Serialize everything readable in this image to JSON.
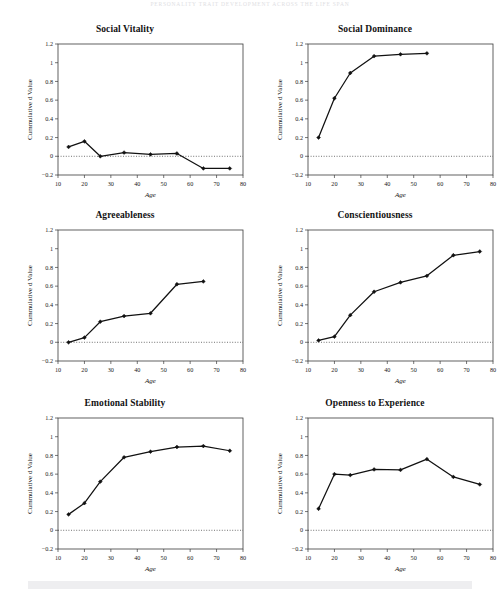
{
  "page": {
    "running_head": "PERSONALITY TRAIT DEVELOPMENT ACROSS THE LIFE SPAN",
    "footer_left_mark": "",
    "footer_right_mark": ""
  },
  "figure": {
    "shared": {
      "xlabel": "Age",
      "ylabel": "Cummulative d Value",
      "xlim": [
        10,
        80
      ],
      "ylim": [
        -0.2,
        1.2
      ],
      "xticks": [
        10,
        20,
        30,
        40,
        50,
        60,
        70,
        80
      ],
      "yticks": [
        -0.2,
        0,
        0.2,
        0.4,
        0.6,
        0.8,
        1,
        1.2
      ],
      "ytick_labels": [
        "−0.2",
        "0",
        "0.2",
        "0.4",
        "0.6",
        "0.8",
        "1",
        "1.2"
      ],
      "xtick_labels": [
        "10",
        "20",
        "30",
        "40",
        "50",
        "60",
        "70",
        "80"
      ],
      "zero_reference": 0,
      "grid": false,
      "legend": "none",
      "line_color": "#111111",
      "marker": "diamond"
    }
  },
  "chart_data": [
    {
      "type": "line",
      "title": "Social Vitality",
      "xlabel": "Age",
      "ylabel": "Cummulative d Value",
      "xlim": [
        10,
        80
      ],
      "ylim": [
        -0.2,
        1.2
      ],
      "x": [
        14,
        20,
        26,
        35,
        45,
        55,
        65,
        75
      ],
      "values": [
        0.1,
        0.16,
        0.0,
        0.04,
        0.02,
        0.03,
        -0.13,
        -0.13
      ]
    },
    {
      "type": "line",
      "title": "Social Dominance",
      "xlabel": "Age",
      "ylabel": "Cummulative d Value",
      "xlim": [
        10,
        80
      ],
      "ylim": [
        -0.2,
        1.2
      ],
      "x": [
        14,
        20,
        26,
        35,
        45,
        55
      ],
      "values": [
        0.2,
        0.62,
        0.89,
        1.07,
        1.09,
        1.1
      ]
    },
    {
      "type": "line",
      "title": "Agreeableness",
      "xlabel": "Age",
      "ylabel": "Cummulative d Value",
      "xlim": [
        10,
        80
      ],
      "ylim": [
        -0.2,
        1.2
      ],
      "x": [
        14,
        20,
        26,
        35,
        45,
        55,
        65
      ],
      "values": [
        0.0,
        0.05,
        0.22,
        0.28,
        0.31,
        0.62,
        0.65
      ]
    },
    {
      "type": "line",
      "title": "Conscientiousness",
      "xlabel": "Age",
      "ylabel": "Cummulative d Value",
      "xlim": [
        10,
        80
      ],
      "ylim": [
        -0.2,
        1.2
      ],
      "x": [
        14,
        20,
        26,
        35,
        45,
        55,
        65,
        75
      ],
      "values": [
        0.02,
        0.06,
        0.29,
        0.54,
        0.64,
        0.71,
        0.93,
        0.97
      ]
    },
    {
      "type": "line",
      "title": "Emotional Stability",
      "xlabel": "Age",
      "ylabel": "Cummulative d Value",
      "xlim": [
        10,
        80
      ],
      "ylim": [
        -0.2,
        1.2
      ],
      "x": [
        14,
        20,
        26,
        35,
        45,
        55,
        65,
        75
      ],
      "values": [
        0.17,
        0.29,
        0.52,
        0.78,
        0.84,
        0.89,
        0.9,
        0.85
      ]
    },
    {
      "type": "line",
      "title": "Openness to Experience",
      "xlabel": "Age",
      "ylabel": "Cummulative d Value",
      "xlim": [
        10,
        80
      ],
      "ylim": [
        -0.2,
        1.2
      ],
      "x": [
        14,
        20,
        26,
        35,
        45,
        55,
        65,
        75
      ],
      "values": [
        0.23,
        0.6,
        0.59,
        0.65,
        0.645,
        0.76,
        0.57,
        0.49
      ]
    }
  ]
}
